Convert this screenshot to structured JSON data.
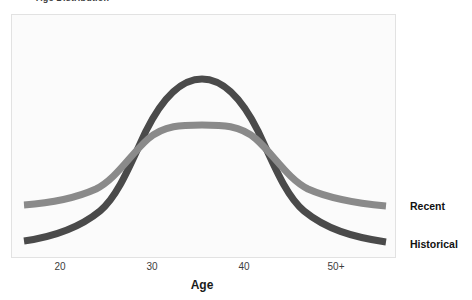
{
  "title": {
    "text": "Age Distribution",
    "clipped": true
  },
  "axis": {
    "x_title": "Age",
    "x_ticks": [
      {
        "label": "20",
        "x": 60
      },
      {
        "label": "30",
        "x": 152
      },
      {
        "label": "40",
        "x": 244
      },
      {
        "label": "50+",
        "x": 336
      }
    ],
    "x_title_x": 202
  },
  "series_labels": [
    {
      "name": "Recent",
      "y": 200,
      "color": "#8a8a8a"
    },
    {
      "name": "Historical",
      "y": 238,
      "color": "#4a4a4a"
    }
  ],
  "colors": {
    "historical": "#4a4a4a",
    "recent": "#8a8a8a",
    "panel_bg": "#fbfbfb",
    "panel_border": "#e2e2e2",
    "page_bg": "#ffffff",
    "tick_text": "#3d3d3d",
    "label_text": "#111111"
  },
  "chart_data": {
    "type": "line",
    "title": "Age Distribution",
    "xlabel": "Age",
    "ylabel": "",
    "grid": false,
    "legend_position": "right-inline-labels",
    "x_tick_labels": [
      "20",
      "30",
      "40",
      "50+"
    ],
    "x_tick_values": [
      20,
      30,
      40,
      50
    ],
    "xlim": [
      16,
      56
    ],
    "ylim": [
      0,
      1
    ],
    "annotation": "Two overlapping density curves; Historical is taller and narrower, Recent is flatter and wider. Curves cross near age 25 and age 44.",
    "x": [
      16,
      18,
      20,
      22,
      24,
      26,
      28,
      30,
      32,
      34,
      36,
      38,
      40,
      42,
      44,
      46,
      48,
      50,
      52,
      54,
      56
    ],
    "series": [
      {
        "name": "Historical",
        "color": "#4a4a4a",
        "values": [
          0.06,
          0.08,
          0.11,
          0.17,
          0.26,
          0.39,
          0.54,
          0.7,
          0.84,
          0.94,
          0.99,
          1.0,
          0.96,
          0.87,
          0.73,
          0.57,
          0.41,
          0.27,
          0.17,
          0.1,
          0.06
        ]
      },
      {
        "name": "Recent",
        "color": "#8a8a8a",
        "values": [
          0.2,
          0.22,
          0.25,
          0.29,
          0.34,
          0.4,
          0.47,
          0.54,
          0.6,
          0.65,
          0.68,
          0.69,
          0.68,
          0.65,
          0.6,
          0.54,
          0.47,
          0.4,
          0.34,
          0.29,
          0.25
        ]
      }
    ]
  },
  "geometry": {
    "panel": {
      "left": 11,
      "top": 14,
      "width": 385,
      "height": 244
    },
    "historical_path": "M 12,226 C 40,222 66,214 88,196 C 106,181 118,150 134,116 C 150,84 168,64 190,64 C 212,64 230,84 246,116 C 262,150 274,181 292,196 C 314,214 340,222 374,227",
    "recent_path": "M 12,190 C 40,188 64,183 84,174 C 104,164 118,140 136,124 C 152,110 170,110 190,110 C 210,110 228,110 244,124 C 262,140 276,164 296,174 C 316,183 342,188 374,191",
    "stroke_width": 7
  }
}
